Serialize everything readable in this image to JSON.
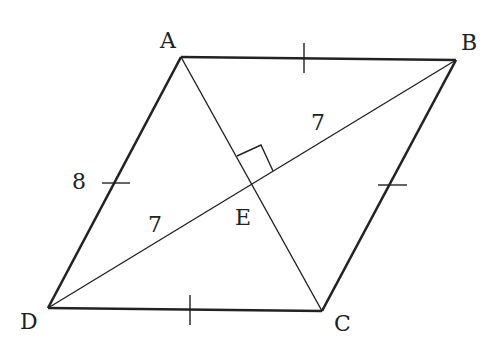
{
  "figure": {
    "type": "rhombus-diagram",
    "vertices": {
      "A": {
        "label": "A",
        "x": 181,
        "y": 57
      },
      "B": {
        "label": "B",
        "x": 456,
        "y": 60
      },
      "C": {
        "label": "C",
        "x": 322,
        "y": 311
      },
      "D": {
        "label": "D",
        "x": 48,
        "y": 308
      },
      "E": {
        "label": "E",
        "x": 251,
        "y": 183
      }
    },
    "measurements": {
      "side_AD": "8",
      "segment_BE": "7",
      "segment_DE": "7"
    },
    "right_angle_at": "E",
    "equal_side_ticks": [
      "AB",
      "BC",
      "CD",
      "DA"
    ],
    "colors": {
      "stroke": "#222222",
      "background": "#ffffff"
    }
  }
}
